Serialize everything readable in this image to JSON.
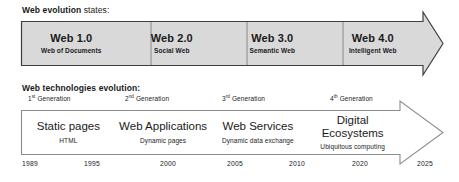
{
  "sections": {
    "evolution": {
      "title_bold": "Web evolution",
      "title_rest": " states:"
    },
    "technologies": {
      "title": "Web technologies evolution:"
    }
  },
  "colors": {
    "arrow_fill_top": "#d9d9d9",
    "arrow_fill_bottom": "#ffffff",
    "arrow_stroke_top": "#3f3f3f",
    "arrow_stroke_bottom": "#8c8c8c",
    "divider": "#808080",
    "text": "#1a1a1a"
  },
  "web_states": [
    {
      "title": "Web 1.0",
      "subtitle": "Web of Documents"
    },
    {
      "title": "Web 2.0",
      "subtitle": "Social Web"
    },
    {
      "title": "Web 3.0",
      "subtitle": "Semantic Web"
    },
    {
      "title": "Web 4.0",
      "subtitle": "Intelligent Web"
    }
  ],
  "generations": [
    {
      "number": "1",
      "ordinal": "st",
      "label": " Generation",
      "x": 7
    },
    {
      "number": "2",
      "ordinal": "nd",
      "label": " Generation",
      "x": 104
    },
    {
      "number": "3",
      "ordinal": "rd",
      "label": " Generation",
      "x": 201
    },
    {
      "number": "4",
      "ordinal": "th",
      "label": " Generation",
      "x": 309
    }
  ],
  "technologies": [
    {
      "title": "Static pages",
      "subtitle": "HTML"
    },
    {
      "title": "Web Applications",
      "subtitle": "Dynamic pages"
    },
    {
      "title": "Web Services",
      "subtitle": "Dynamic data exchange"
    },
    {
      "title": "Digital Ecosystems",
      "subtitle": "Ubiquitous computing"
    }
  ],
  "years": [
    {
      "label": "1989",
      "x": 22
    },
    {
      "label": "1995",
      "x": 84
    },
    {
      "label": "2000",
      "x": 160
    },
    {
      "label": "2005",
      "x": 227
    },
    {
      "label": "2010",
      "x": 289
    },
    {
      "label": "2020",
      "x": 352
    },
    {
      "label": "2025",
      "x": 417
    }
  ]
}
